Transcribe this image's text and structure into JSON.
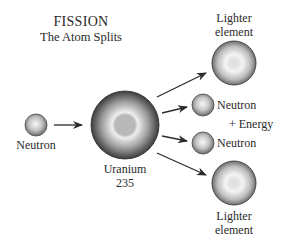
{
  "title": {
    "main": "FISSION",
    "sub": "The Atom Splits"
  },
  "nodes": {
    "incoming_neutron": {
      "label": "Neutron"
    },
    "uranium": {
      "label_line1": "Uranium",
      "label_line2": "235"
    },
    "lighter_top": {
      "label_line1": "Lighter",
      "label_line2": "element"
    },
    "neutron_out_1": {
      "label": "Neutron"
    },
    "energy": {
      "label": "+ Energy"
    },
    "neutron_out_2": {
      "label": "Neutron"
    },
    "lighter_bottom": {
      "label_line1": "Lighter",
      "label_line2": "element"
    }
  },
  "colors": {
    "sphere_dark": "#3a3a3a",
    "sphere_light": "#f2f2f2",
    "core": "#bdbdbd",
    "arrow": "#2b2b2b"
  }
}
